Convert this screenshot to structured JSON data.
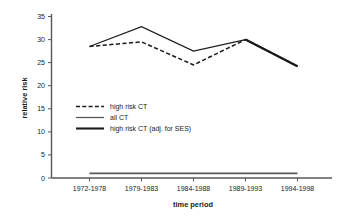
{
  "chart_data": {
    "type": "line",
    "title": "",
    "xlabel": "time period",
    "ylabel": "relative risk",
    "categories": [
      "1972-1978",
      "1979-1983",
      "1984-1988",
      "1989-1993",
      "1994-1998"
    ],
    "ylim": [
      0,
      35
    ],
    "yticks": [
      0,
      5,
      10,
      15,
      20,
      25,
      30,
      35
    ],
    "grid": false,
    "legend_position": "center-left",
    "series": [
      {
        "name": "high risk CT",
        "style": "dashed",
        "color": "#1a1a1a",
        "values": [
          28.5,
          29.5,
          24.5,
          30.0,
          24.2
        ]
      },
      {
        "name": "all CT",
        "style": "solid",
        "color": "#1a1a1a",
        "values": [
          28.5,
          32.8,
          27.5,
          30.0,
          24.2
        ]
      },
      {
        "name": "high risk CT (adj. for SES)",
        "style": "thick",
        "color": "#1a1a1a",
        "values": [
          1.0,
          1.0,
          1.0,
          1.0,
          1.0
        ]
      }
    ]
  },
  "axis": {
    "ytick_labels": [
      "35",
      "30",
      "25",
      "20",
      "15",
      "10",
      "5",
      "0"
    ],
    "ylabel": "relative risk",
    "xlabel": "time period",
    "xtick_labels": [
      "1972-1978",
      "1979-1983",
      "1984-1988",
      "1989-1993",
      "1994-1998"
    ]
  },
  "legend": {
    "items": [
      {
        "label": "high risk CT"
      },
      {
        "label": "all CT"
      },
      {
        "label": "high risk CT (adj. for SES)"
      }
    ]
  }
}
